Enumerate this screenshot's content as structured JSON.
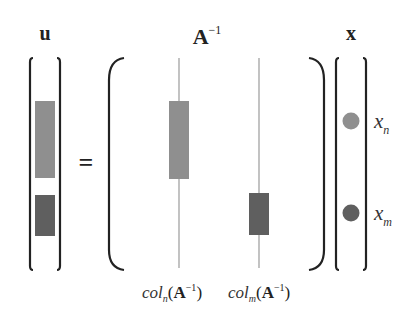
{
  "diagram": {
    "equation": "u = A^-1 x",
    "labels": {
      "u": "u",
      "A": "A",
      "A_exp": "−1",
      "x": "x",
      "equals": "="
    },
    "vector_u": {
      "blocks": [
        {
          "name": "u-block-n",
          "color": "#8f8f8f"
        },
        {
          "name": "u-block-m",
          "color": "#5f5f5f"
        }
      ]
    },
    "matrix_A_inv": {
      "columns": [
        {
          "name": "col_n",
          "label_base": "col",
          "label_sub": "n",
          "label_arg": "A",
          "label_exp": "−1",
          "block_color": "#8f8f8f"
        },
        {
          "name": "col_m",
          "label_base": "col",
          "label_sub": "m",
          "label_arg": "A",
          "label_exp": "−1",
          "block_color": "#5f5f5f"
        }
      ]
    },
    "vector_x": {
      "entries": [
        {
          "name": "x_n",
          "label_base": "x",
          "label_sub": "n",
          "color": "#8f8f8f"
        },
        {
          "name": "x_m",
          "label_base": "x",
          "label_sub": "m",
          "color": "#5f5f5f"
        }
      ]
    },
    "colors": {
      "bracket": "#222222",
      "column_line": "#9a9a9a",
      "light_block": "#8f8f8f",
      "dark_block": "#5f5f5f"
    }
  }
}
